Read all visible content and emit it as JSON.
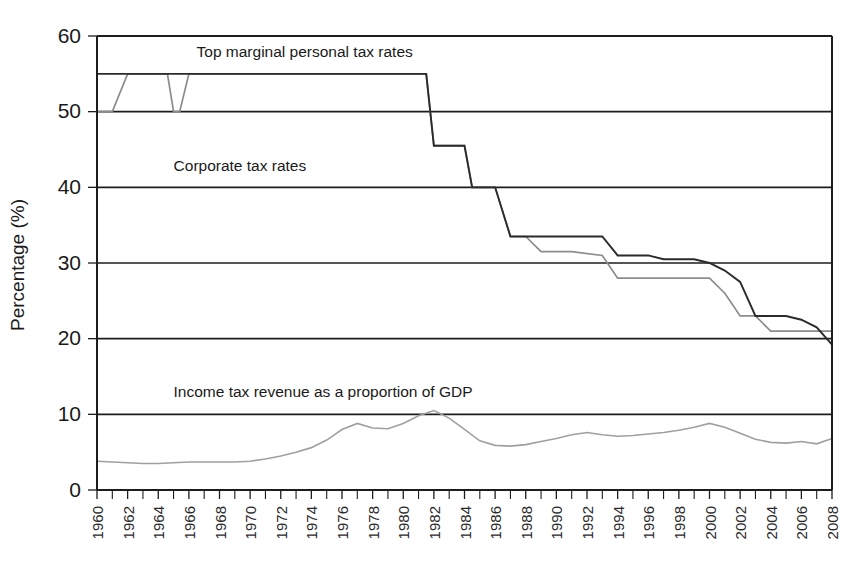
{
  "chart_data": {
    "type": "line",
    "title": "",
    "xlabel": "",
    "ylabel": "Percentage (%)",
    "xlim": [
      1960,
      2008
    ],
    "ylim": [
      0,
      60
    ],
    "yticks": [
      0,
      10,
      20,
      30,
      40,
      50,
      60
    ],
    "xticks": [
      1960,
      1962,
      1964,
      1966,
      1968,
      1970,
      1972,
      1974,
      1976,
      1978,
      1980,
      1982,
      1984,
      1986,
      1988,
      1990,
      1992,
      1994,
      1996,
      1998,
      2000,
      2002,
      2004,
      2006,
      2008
    ],
    "grid": "horizontal",
    "legend_position": "inline-annotations",
    "annotations": [
      {
        "text": "Top marginal personal tax rates",
        "x": 1966.5,
        "y": 57.2
      },
      {
        "text": "Corporate tax rates",
        "x": 1965.0,
        "y": 42.2
      },
      {
        "text": "Income tax revenue as a proportion of GDP",
        "x": 1965.0,
        "y": 12.3
      }
    ],
    "series": [
      {
        "name": "Top marginal personal tax rates",
        "color": "#8c8c8c",
        "stroke_width": 1.7,
        "x": [
          1960,
          1961,
          1962,
          1964,
          1964.6,
          1965,
          1965.4,
          1966,
          1980.5,
          1981.5,
          1982,
          1984,
          1984.5,
          1986,
          1987,
          1988,
          1989,
          1990,
          1991,
          1993,
          1994,
          1995,
          1996,
          1997,
          1998,
          1999,
          2000,
          2001,
          2002,
          2003,
          2004,
          2005,
          2006,
          2007,
          2008
        ],
        "values": [
          50,
          50,
          55,
          55,
          55,
          50,
          50,
          55,
          55,
          55,
          45.5,
          45.5,
          40,
          40,
          33.5,
          33.5,
          31.5,
          31.5,
          31.5,
          31.0,
          28.0,
          28.0,
          28.0,
          28.0,
          28.0,
          28.0,
          28.0,
          26.0,
          23.0,
          23.0,
          21.0,
          21.0,
          21.0,
          21.0,
          21.0
        ]
      },
      {
        "name": "Corporate tax rates",
        "color": "#2b2b2b",
        "stroke_width": 1.9,
        "x": [
          1960,
          1980.5,
          1981.5,
          1982,
          1984,
          1984.5,
          1986,
          1987,
          1988,
          1989,
          1991,
          1993,
          1994,
          1995,
          1996,
          1997,
          1999,
          2000,
          2001,
          2002,
          2003,
          2004,
          2005,
          2006,
          2007,
          2008
        ],
        "values": [
          55,
          55,
          55,
          45.5,
          45.5,
          40,
          40,
          33.5,
          33.5,
          33.5,
          33.5,
          33.5,
          31.0,
          31.0,
          31.0,
          30.5,
          30.5,
          30.0,
          29.0,
          27.5,
          23.0,
          23.0,
          23.0,
          22.5,
          21.5,
          19.2
        ]
      },
      {
        "name": "Income tax revenue as a proportion of GDP",
        "color": "#a0a0a0",
        "stroke_width": 1.6,
        "x": [
          1960,
          1961,
          1962,
          1963,
          1964,
          1965,
          1966,
          1967,
          1968,
          1969,
          1970,
          1971,
          1972,
          1973,
          1974,
          1975,
          1976,
          1977,
          1978,
          1979,
          1980,
          1981,
          1982,
          1983,
          1984,
          1985,
          1986,
          1987,
          1988,
          1989,
          1990,
          1991,
          1992,
          1993,
          1994,
          1995,
          1996,
          1997,
          1998,
          1999,
          2000,
          2001,
          2002,
          2003,
          2004,
          2005,
          2006,
          2007,
          2008
        ],
        "values": [
          3.8,
          3.7,
          3.6,
          3.5,
          3.5,
          3.6,
          3.7,
          3.7,
          3.7,
          3.7,
          3.8,
          4.1,
          4.5,
          5.0,
          5.6,
          6.6,
          8.0,
          8.8,
          8.2,
          8.1,
          8.8,
          9.8,
          10.5,
          9.5,
          8.0,
          6.5,
          5.9,
          5.8,
          6.0,
          6.4,
          6.8,
          7.3,
          7.6,
          7.3,
          7.1,
          7.2,
          7.4,
          7.6,
          7.9,
          8.3,
          8.8,
          8.3,
          7.5,
          6.7,
          6.3,
          6.2,
          6.4,
          6.1,
          6.8
        ]
      }
    ]
  }
}
